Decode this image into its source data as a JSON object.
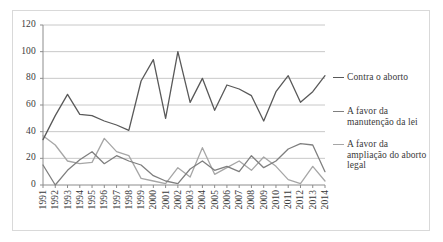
{
  "chart_data": {
    "type": "line",
    "title": "",
    "xlabel": "",
    "ylabel": "",
    "ylim": [
      0,
      120
    ],
    "yticks": [
      0,
      20,
      40,
      60,
      80,
      100,
      120
    ],
    "grid": true,
    "legend_position": "right",
    "categories": [
      "1991",
      "1992",
      "1993",
      "1994",
      "1995",
      "1996",
      "1997",
      "1998",
      "1999",
      "2000",
      "2001",
      "2002",
      "2003",
      "2004",
      "2005",
      "2006",
      "2007",
      "2008",
      "2009",
      "2010",
      "2011",
      "2012",
      "2013",
      "2014"
    ],
    "series": [
      {
        "name": "Contra o aborto",
        "color": "#595959",
        "values": [
          34,
          52,
          68,
          53,
          52,
          48,
          45,
          41,
          78,
          94,
          50,
          100,
          62,
          80,
          56,
          75,
          72,
          67,
          48,
          70,
          82,
          62,
          70,
          82
        ]
      },
      {
        "name": "A favor da manutenção da lei",
        "color": "#7f7f7f",
        "values": [
          15,
          0,
          11,
          19,
          25,
          16,
          22,
          18,
          15,
          7,
          3,
          1,
          12,
          18,
          11,
          14,
          10,
          22,
          13,
          18,
          27,
          31,
          30,
          10
        ]
      },
      {
        "name": "A favor da ampliação do aborto legal",
        "color": "#a6a6a6",
        "values": [
          37,
          30,
          18,
          16,
          17,
          35,
          25,
          22,
          5,
          3,
          1,
          13,
          6,
          28,
          8,
          13,
          18,
          11,
          21,
          14,
          4,
          1,
          14,
          3
        ]
      }
    ]
  },
  "legend": {
    "entries": [
      {
        "label": "Contra o aborto"
      },
      {
        "label": "A favor da\nmanutenção da lei"
      },
      {
        "label": "A favor da\nampliação do aborto\nlegal"
      }
    ]
  },
  "colors": {
    "series1": "#595959",
    "series2": "#7f7f7f",
    "series3": "#a6a6a6",
    "gridline": "#c8c8c8",
    "axis": "#8c8c8c",
    "border": "#d9d9d9",
    "text": "#3a3a3a"
  }
}
